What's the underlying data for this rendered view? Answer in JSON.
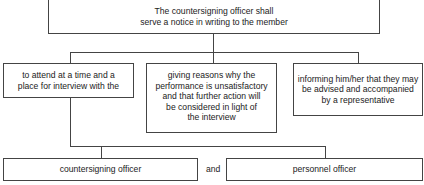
{
  "diagram": {
    "type": "flowchart",
    "root": {
      "text": "The countersigning officer shall serve a notice in writing to the member",
      "line1": "The countersigning officer shall",
      "line2": "serve a notice in writing to the member"
    },
    "branches": [
      {
        "id": "attend",
        "text": "to attend at a time and a place for interview with the",
        "line1": "to attend at a time and a",
        "line2": "place for interview with the"
      },
      {
        "id": "reasons",
        "text": "giving reasons why the performance is unsatisfactory and that further action will be considered in light of the interview",
        "line1": "giving reasons why the",
        "line2": "performance is unsatisfactory",
        "line3": "and that further action will",
        "line4": "be considered in light of",
        "line5": "the interview"
      },
      {
        "id": "representative",
        "text": "informing him/her that they may be advised and accompanied by a representative",
        "line1": "informing him/her that they may",
        "line2": "be advised and accompanied",
        "line3": "by a representative"
      }
    ],
    "interviewers": [
      {
        "text": "countersigning officer"
      },
      {
        "text": "personnel officer"
      }
    ],
    "conjunction": "and"
  }
}
